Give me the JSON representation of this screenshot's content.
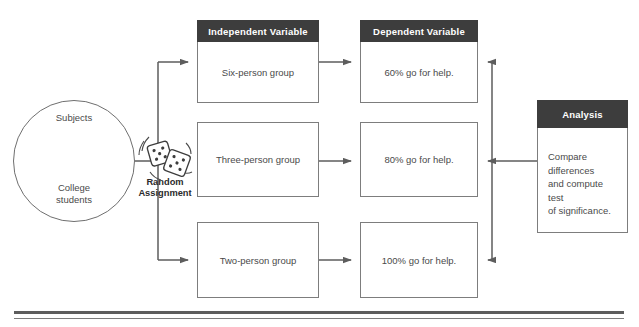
{
  "diagram": {
    "colors": {
      "header_fill": "#3d3d3d",
      "header_text": "#ffffff",
      "box_border": "#7d7d7d",
      "body_text": "#4a4a4a",
      "line": "#5d5d5d",
      "cap_fill": "#3d3d3d"
    }
  },
  "subjects": {
    "top_label": "Subjects",
    "bottom_label": "College\nstudents",
    "bottom_line1": "College",
    "bottom_line2": "students",
    "icon": "graduation-cap-icon"
  },
  "random_assignment": {
    "label_line1": "Random",
    "label_line2": "Assignment",
    "icon": "dice-icon"
  },
  "columns": {
    "independent": {
      "header": "Independent Variable"
    },
    "dependent": {
      "header": "Dependent Variable"
    },
    "analysis": {
      "header": "Analysis",
      "body_line1": "Compare differences",
      "body_line2": "and compute test",
      "body_line3": "of significance."
    }
  },
  "rows": [
    {
      "independent": "Six-person group",
      "dependent": "60% go for help."
    },
    {
      "independent": "Three-person group",
      "dependent": "80% go for help."
    },
    {
      "independent": "Two-person group",
      "dependent": "100% go for help."
    }
  ]
}
